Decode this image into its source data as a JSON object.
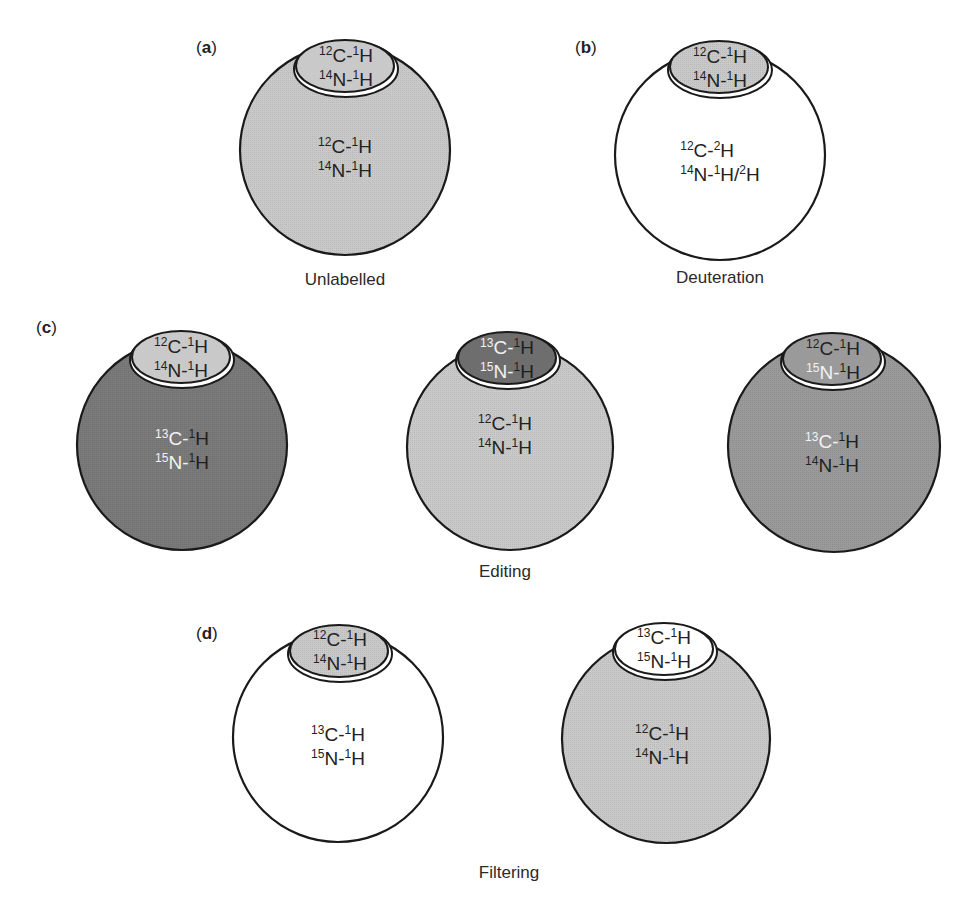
{
  "colors": {
    "unlabelled_fill": "#c9c9c9",
    "dark_fill": "#7a7a7a",
    "medium_fill": "#9a9a9a",
    "white_fill": "#ffffff",
    "outline": "#1a1a1a"
  },
  "panels": {
    "a": {
      "label": "a",
      "caption": "Unlabelled",
      "cap": {
        "fill": "unlabelled",
        "lines": [
          {
            "mass": "12",
            "el": "C",
            "hmass": "1"
          },
          {
            "mass": "14",
            "el": "N",
            "hmass": "1"
          }
        ]
      },
      "body": {
        "fill": "unlabelled",
        "lines": [
          {
            "mass": "12",
            "el": "C",
            "hmass": "1"
          },
          {
            "mass": "14",
            "el": "N",
            "hmass": "1"
          }
        ]
      }
    },
    "b": {
      "label": "b",
      "caption": "Deuteration",
      "cap": {
        "fill": "unlabelled",
        "lines": [
          {
            "mass": "12",
            "el": "C",
            "hmass": "1"
          },
          {
            "mass": "14",
            "el": "N",
            "hmass": "1"
          }
        ]
      },
      "body": {
        "fill": "white",
        "line1": {
          "mass": "12",
          "el": "C",
          "hmass": "2"
        },
        "line2": {
          "mass": "14",
          "el": "N",
          "hmass": "1",
          "alt": "/",
          "hmass2": "2"
        }
      }
    },
    "c": {
      "label": "c",
      "caption": "Editing",
      "left": {
        "cap": {
          "fill": "unlabelled",
          "lines": [
            {
              "mass": "12",
              "el": "C",
              "hmass": "1"
            },
            {
              "mass": "14",
              "el": "N",
              "hmass": "1"
            }
          ]
        },
        "body": {
          "fill": "dark",
          "lines": [
            {
              "mass": "13",
              "el": "C",
              "hmass": "1"
            },
            {
              "mass": "15",
              "el": "N",
              "hmass": "1"
            }
          ]
        }
      },
      "middle": {
        "cap": {
          "fill": "dark",
          "lines": [
            {
              "mass": "13",
              "el": "C",
              "hmass": "1"
            },
            {
              "mass": "15",
              "el": "N",
              "hmass": "1"
            }
          ]
        },
        "body": {
          "fill": "unlabelled",
          "lines": [
            {
              "mass": "12",
              "el": "C",
              "hmass": "1"
            },
            {
              "mass": "14",
              "el": "N",
              "hmass": "1"
            }
          ]
        }
      },
      "right": {
        "cap": {
          "fill": "medium",
          "lines": [
            {
              "mass": "12",
              "el": "C",
              "hmass": "1"
            },
            {
              "mass": "15",
              "el": "N",
              "hmass": "1"
            }
          ]
        },
        "body": {
          "fill": "medium",
          "lines": [
            {
              "mass": "13",
              "el": "C",
              "hmass": "1"
            },
            {
              "mass": "14",
              "el": "N",
              "hmass": "1"
            }
          ]
        }
      }
    },
    "d": {
      "label": "d",
      "caption": "Filtering",
      "left": {
        "cap": {
          "fill": "unlabelled",
          "lines": [
            {
              "mass": "12",
              "el": "C",
              "hmass": "1"
            },
            {
              "mass": "14",
              "el": "N",
              "hmass": "1"
            }
          ]
        },
        "body": {
          "fill": "white",
          "lines": [
            {
              "mass": "13",
              "el": "C",
              "hmass": "1"
            },
            {
              "mass": "15",
              "el": "N",
              "hmass": "1"
            }
          ]
        }
      },
      "right": {
        "cap": {
          "fill": "white",
          "lines": [
            {
              "mass": "13",
              "el": "C",
              "hmass": "1"
            },
            {
              "mass": "15",
              "el": "N",
              "hmass": "1"
            }
          ]
        },
        "body": {
          "fill": "unlabelled",
          "lines": [
            {
              "mass": "12",
              "el": "C",
              "hmass": "1"
            },
            {
              "mass": "14",
              "el": "N",
              "hmass": "1"
            }
          ]
        }
      }
    }
  },
  "dash": "-",
  "h_symbol": "H"
}
